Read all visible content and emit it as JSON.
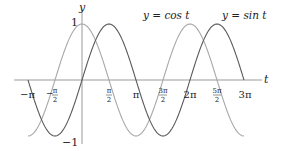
{
  "chart_data": {
    "type": "line",
    "title": "",
    "xlabel": "t",
    "ylabel": "y",
    "xlim": [
      -3.4,
      10.2
    ],
    "ylim": [
      -1.15,
      1.15
    ],
    "grid": false,
    "legend_position": "inline-top",
    "x_ticks": [
      {
        "value": -3.14159,
        "label": "−π"
      },
      {
        "value": -1.5708,
        "label": "−π/2"
      },
      {
        "value": 1.5708,
        "label": "π/2"
      },
      {
        "value": 3.14159,
        "label": "π"
      },
      {
        "value": 4.71239,
        "label": "3π/2"
      },
      {
        "value": 6.28319,
        "label": "2π"
      },
      {
        "value": 7.85398,
        "label": "5π/2"
      },
      {
        "value": 9.42478,
        "label": "3π"
      }
    ],
    "y_ticks": [
      {
        "value": 1,
        "label": "1"
      },
      {
        "value": -1,
        "label": "−1"
      }
    ],
    "series": [
      {
        "name": "y = cos t",
        "function": "cos",
        "domain": [
          -3.14159,
          9.42478
        ],
        "color": "#a8a8a8"
      },
      {
        "name": "y = sin t",
        "function": "sin",
        "domain": [
          -3.14159,
          9.42478
        ],
        "color": "#5a5a5a"
      }
    ],
    "annotations": [
      {
        "text": "y = cos t",
        "near_x": 4.7
      },
      {
        "text": "y = sin t",
        "near_x": 7.85
      }
    ]
  },
  "labels": {
    "y_axis": "y",
    "x_axis": "t",
    "y_one": "1",
    "y_neg_one": "−1",
    "cos_legend": "y = cos t",
    "sin_legend": "y = sin t",
    "neg_pi": "−π",
    "neg_half_pi_num": "π",
    "pi": "π",
    "half_pi_num": "π",
    "three_half_pi_num": "3π",
    "two_pi": "2π",
    "five_half_pi_num": "5π",
    "three_pi": "3π",
    "denom_two": "2"
  }
}
